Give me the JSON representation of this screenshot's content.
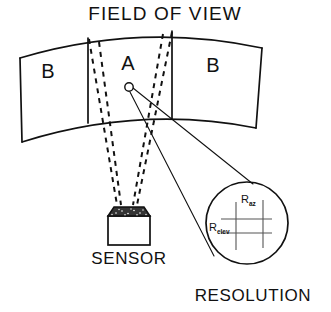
{
  "figure": {
    "title": "FIELD OF VIEW",
    "caption_sensor": "SENSOR",
    "caption_resolution": "RESOLUTION",
    "zones": [
      {
        "id": "left",
        "label": "B"
      },
      {
        "id": "center",
        "label": "A"
      },
      {
        "id": "right",
        "label": "B"
      }
    ],
    "resolution_cell": {
      "azimuth_base": "R",
      "azimuth_sub": "az",
      "elevation_base": "R",
      "elevation_sub": "elev"
    },
    "colors": {
      "ink": "#111111",
      "paper": "#ffffff",
      "sensor_cap": "#333333",
      "grid": "#555555"
    }
  }
}
